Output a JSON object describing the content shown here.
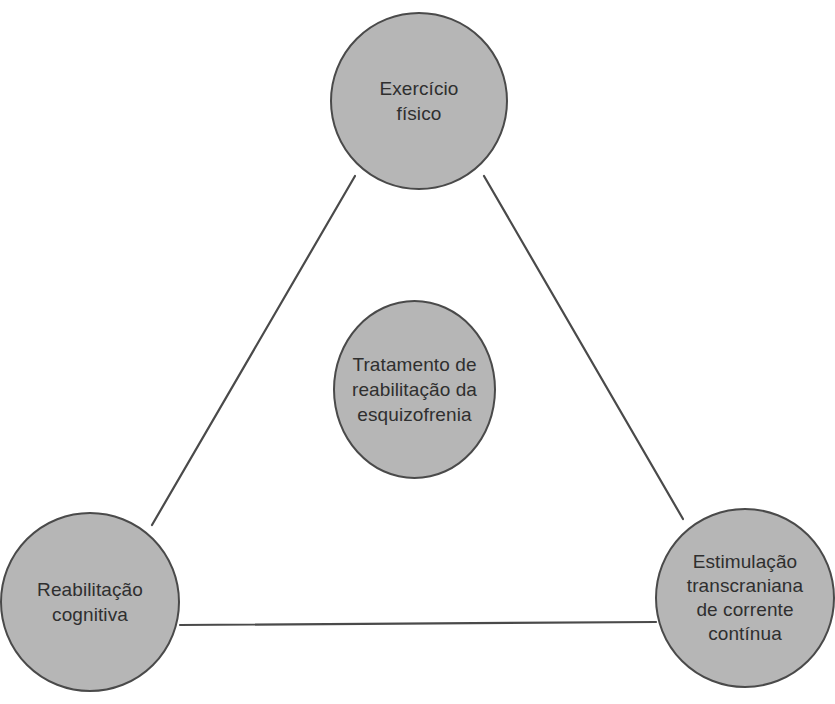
{
  "diagram": {
    "type": "triangle-concept-diagram",
    "background_color": "#ffffff",
    "node_fill_color": "#b6b6b6",
    "node_border_color": "#4a4a4a",
    "edge_color": "#4a4a4a",
    "text_color": "#2f2f2f",
    "nodes": [
      {
        "id": "exercise",
        "label": "Exercício\nfísico",
        "position": "top",
        "cx": 419,
        "cy": 101,
        "r": 89
      },
      {
        "id": "center",
        "label": "Tratamento de\nreabilitação da\nesquizofrenia",
        "position": "center",
        "cx": 414,
        "cy": 389,
        "r": 82
      },
      {
        "id": "cognitive",
        "label": "Reabilitação\ncognitiva",
        "position": "bottom-left",
        "cx": 90,
        "cy": 602,
        "r": 90
      },
      {
        "id": "tdcs",
        "label": "Estimulação\ntranscraniana\nde corrente\ncontínua",
        "position": "bottom-right",
        "cx": 745,
        "cy": 598,
        "r": 90
      }
    ],
    "edges": [
      {
        "id": "edge-exercise-cognitive",
        "from": "exercise",
        "to": "cognitive",
        "x1": 355,
        "y1": 176,
        "x2": 152,
        "y2": 525
      },
      {
        "id": "edge-exercise-tdcs",
        "from": "exercise",
        "to": "tdcs",
        "x1": 484,
        "y1": 176,
        "x2": 683,
        "y2": 519
      },
      {
        "id": "edge-cognitive-tdcs",
        "from": "cognitive",
        "to": "tdcs",
        "x1": 180,
        "y1": 625,
        "x2": 656,
        "y2": 622
      }
    ]
  }
}
